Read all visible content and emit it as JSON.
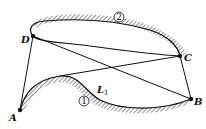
{
  "labels": {
    "A": "A",
    "B": "B",
    "C": "C",
    "D": "D",
    "L1": "L",
    "L1_sub": "1",
    "path1": "1",
    "path2": "2"
  },
  "colors": {
    "ink": "#111111",
    "background": "#ffffff"
  }
}
